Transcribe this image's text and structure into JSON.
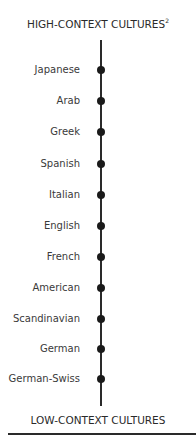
{
  "diagram": {
    "top_label": "HIGH-CONTEXT CULTURES",
    "top_label_footnote": "2",
    "bottom_label": "LOW-CONTEXT CULTURES",
    "items": [
      {
        "label": "Japanese"
      },
      {
        "label": "Arab"
      },
      {
        "label": "Greek"
      },
      {
        "label": "Spanish"
      },
      {
        "label": "Italian"
      },
      {
        "label": "English"
      },
      {
        "label": "French"
      },
      {
        "label": "American"
      },
      {
        "label": "Scandinavian"
      },
      {
        "label": "German"
      },
      {
        "label": "German-Swiss"
      }
    ],
    "colors": {
      "line": "#2a2a2a",
      "dot": "#1a1a1a",
      "text": "#3a3a3a"
    }
  }
}
